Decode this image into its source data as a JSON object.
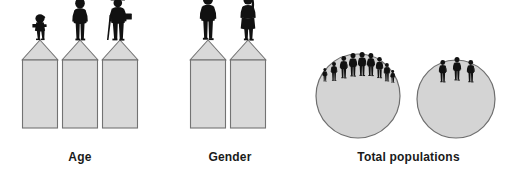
{
  "figure": {
    "title": "",
    "background_color": "#ffffff",
    "pedestal_fill": "#d9d9d9",
    "pedestal_stroke": "#737373",
    "circle_fill": "#d4d4d4",
    "circle_stroke": "#6e6e6e",
    "silhouette_color": "#111111",
    "caption_color": "#1a1a1a"
  },
  "panels": [
    {
      "id": "age",
      "caption": "Age",
      "kind": "pedestals",
      "pedestal_count": 3,
      "figures": [
        {
          "name": "child-silhouette",
          "label": "child"
        },
        {
          "name": "adult-silhouette",
          "label": "adult"
        },
        {
          "name": "elderly-silhouette",
          "label": "elderly"
        }
      ]
    },
    {
      "id": "gender",
      "caption": "Gender",
      "kind": "pedestals",
      "pedestal_count": 2,
      "figures": [
        {
          "name": "male-silhouette",
          "label": "male"
        },
        {
          "name": "female-silhouette",
          "label": "female"
        }
      ]
    },
    {
      "id": "total-populations",
      "caption": "Total populations",
      "kind": "circles",
      "circle_count": 2,
      "circles": [
        {
          "name": "large-population-circle",
          "people_count": 9
        },
        {
          "name": "small-population-circle",
          "people_count": 3
        }
      ]
    }
  ]
}
